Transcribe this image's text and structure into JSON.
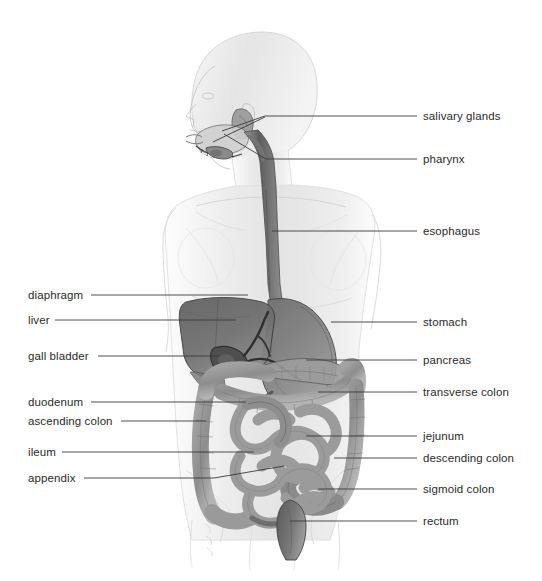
{
  "figure": {
    "background_color": "#ffffff",
    "line_color": "#3a3a3a",
    "text_color": "#2b2b2b",
    "body_tint": "#e9e9e9",
    "organ_tint": "#8f8f8f",
    "organ_dark": "#555555"
  },
  "labels_left": [
    {
      "name": "diaphragm",
      "text": "diaphragm",
      "text_x": 28,
      "text_y": 289,
      "line_x1": 91,
      "line_x2": 248,
      "line_y": 295
    },
    {
      "name": "liver",
      "text": "liver",
      "text_x": 28,
      "text_y": 314,
      "line_x1": 55,
      "line_x2": 236,
      "line_y": 320
    },
    {
      "name": "gall-bladder",
      "text": "gall bladder",
      "text_x": 28,
      "text_y": 350,
      "line_x1": 98,
      "line_x2": 219,
      "line_y": 356
    },
    {
      "name": "duodenum",
      "text": "duodenum",
      "text_x": 28,
      "text_y": 396,
      "line_x1": 91,
      "line_x2": 246,
      "line_y": 402
    },
    {
      "name": "ascending-colon",
      "text": "ascending colon",
      "text_x": 28,
      "text_y": 415,
      "line_x1": 121,
      "line_x2": 206,
      "line_y": 421
    },
    {
      "name": "ileum",
      "text": "ileum",
      "text_x": 28,
      "text_y": 446,
      "line_x1": 62,
      "line_x2": 254,
      "line_y": 452
    },
    {
      "name": "appendix",
      "text": "appendix",
      "text_x": 28,
      "text_y": 472,
      "line_x1": 84,
      "line_x2": 214,
      "line_y": 478
    }
  ],
  "labels_right": [
    {
      "name": "salivary-glands",
      "text": "salivary glands",
      "text_x": 423,
      "text_y": 110,
      "line_x1": 417,
      "line_x2": 265,
      "line_y": 116
    },
    {
      "name": "pharynx",
      "text": "pharynx",
      "text_x": 423,
      "text_y": 153,
      "line_x1": 417,
      "line_x2": 266,
      "line_y": 159
    },
    {
      "name": "esophagus",
      "text": "esophagus",
      "text_x": 423,
      "text_y": 225,
      "line_x1": 417,
      "line_x2": 272,
      "line_y": 231
    },
    {
      "name": "stomach",
      "text": "stomach",
      "text_x": 423,
      "text_y": 316,
      "line_x1": 417,
      "line_x2": 331,
      "line_y": 322
    },
    {
      "name": "pancreas",
      "text": "pancreas",
      "text_x": 423,
      "text_y": 354,
      "line_x1": 417,
      "line_x2": 306,
      "line_y": 360
    },
    {
      "name": "transverse-colon",
      "text": "transverse colon",
      "text_x": 423,
      "text_y": 386,
      "line_x1": 417,
      "line_x2": 318,
      "line_y": 392
    },
    {
      "name": "jejunum",
      "text": "jejunum",
      "text_x": 423,
      "text_y": 430,
      "line_x1": 417,
      "line_x2": 306,
      "line_y": 436
    },
    {
      "name": "descending-colon",
      "text": "descending colon",
      "text_x": 423,
      "text_y": 452,
      "line_x1": 417,
      "line_x2": 334,
      "line_y": 458
    },
    {
      "name": "sigmoid-colon",
      "text": "sigmoid colon",
      "text_x": 423,
      "text_y": 483,
      "line_x1": 417,
      "line_x2": 318,
      "line_y": 489
    },
    {
      "name": "rectum",
      "text": "rectum",
      "text_x": 423,
      "text_y": 515,
      "line_x1": 417,
      "line_x2": 290,
      "line_y": 521
    }
  ],
  "extra_leaders": [
    {
      "name": "salivary-gland-upper-leader",
      "x1": 265,
      "y1": 116,
      "x2": 222,
      "y2": 131
    },
    {
      "name": "salivary-gland-lower-leader",
      "x1": 265,
      "y1": 117,
      "x2": 213,
      "y2": 142
    },
    {
      "name": "pharynx-leader",
      "x1": 266,
      "y1": 159,
      "x2": 224,
      "y2": 134
    },
    {
      "name": "appendix-leader",
      "x1": 214,
      "y1": 478,
      "x2": 284,
      "y2": 466
    }
  ]
}
